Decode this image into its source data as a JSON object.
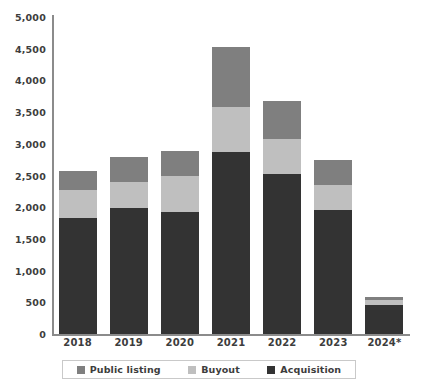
{
  "chart_data": {
    "type": "bar",
    "stacked": true,
    "title": "",
    "xlabel": "",
    "ylabel": "",
    "grid": false,
    "legend_position": "bottom",
    "categories": [
      "2018",
      "2019",
      "2020",
      "2021",
      "2022",
      "2023",
      "2024*"
    ],
    "ytick_labels": [
      "0",
      "500",
      "1,000",
      "1,500",
      "2,000",
      "2,500",
      "3,000",
      "3,500",
      "4,000",
      "4,500",
      "5,000"
    ],
    "ytick_values": [
      0,
      500,
      1000,
      1500,
      2000,
      2500,
      3000,
      3500,
      4000,
      4500,
      5000
    ],
    "ylim": [
      0,
      5000
    ],
    "series": [
      {
        "name": "Acquisition",
        "color": "#333333",
        "values": [
          1830,
          1990,
          1930,
          2870,
          2520,
          1950,
          460
        ]
      },
      {
        "name": "Buyout",
        "color": "#bfbfbf",
        "values": [
          440,
          410,
          560,
          710,
          560,
          400,
          70
        ]
      },
      {
        "name": "Public listing",
        "color": "#7f7f7f",
        "values": [
          300,
          390,
          390,
          950,
          590,
          390,
          50
        ]
      }
    ],
    "totals": [
      2570,
      2790,
      2880,
      4530,
      3670,
      2740,
      580
    ],
    "legend": [
      {
        "label": "Public listing",
        "color": "#7f7f7f"
      },
      {
        "label": "Buyout",
        "color": "#bfbfbf"
      },
      {
        "label": "Acquisition",
        "color": "#333333"
      }
    ]
  }
}
